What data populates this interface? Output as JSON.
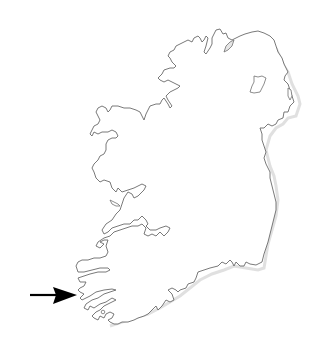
{
  "map": {
    "subject": "Ireland outline map",
    "colors": {
      "background": "#ffffff",
      "coastline": "#6a6a6a",
      "land": "#ffffff",
      "lake_fill": "#e6e6e6",
      "arrow": "#000000"
    },
    "annotations": [
      {
        "type": "arrow",
        "direction": "right",
        "points_to": "southwest coast (Kerry peninsulas)",
        "from": [
          30,
          295
        ],
        "to": [
          77,
          295
        ]
      }
    ],
    "features": [
      {
        "name": "island-of-ireland",
        "type": "landmass"
      },
      {
        "name": "lough-neagh",
        "type": "lake"
      },
      {
        "name": "lough-foyle",
        "type": "inlet"
      },
      {
        "name": "strangford-lough",
        "type": "inlet"
      },
      {
        "name": "shannon-estuary",
        "type": "inlet"
      },
      {
        "name": "kerry-peninsulas",
        "type": "coast"
      }
    ]
  }
}
